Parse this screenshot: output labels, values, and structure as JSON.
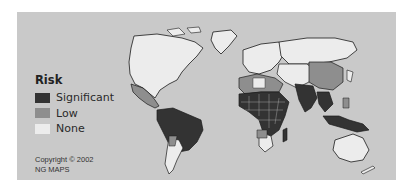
{
  "legend": {
    "title": "Risk",
    "items": [
      {
        "label": "Significant",
        "color": "#333333"
      },
      {
        "label": "Low",
        "color": "#8e8e8e"
      },
      {
        "label": "None",
        "color": "#ececec"
      }
    ]
  },
  "credits": {
    "line1": "Copyright © 2002",
    "line2": "NG MAPS"
  },
  "colors": {
    "ocean": "#c9c9c9",
    "coast": "#1a1a1a",
    "significant": "#333333",
    "low": "#8e8e8e",
    "none": "#ececec"
  }
}
